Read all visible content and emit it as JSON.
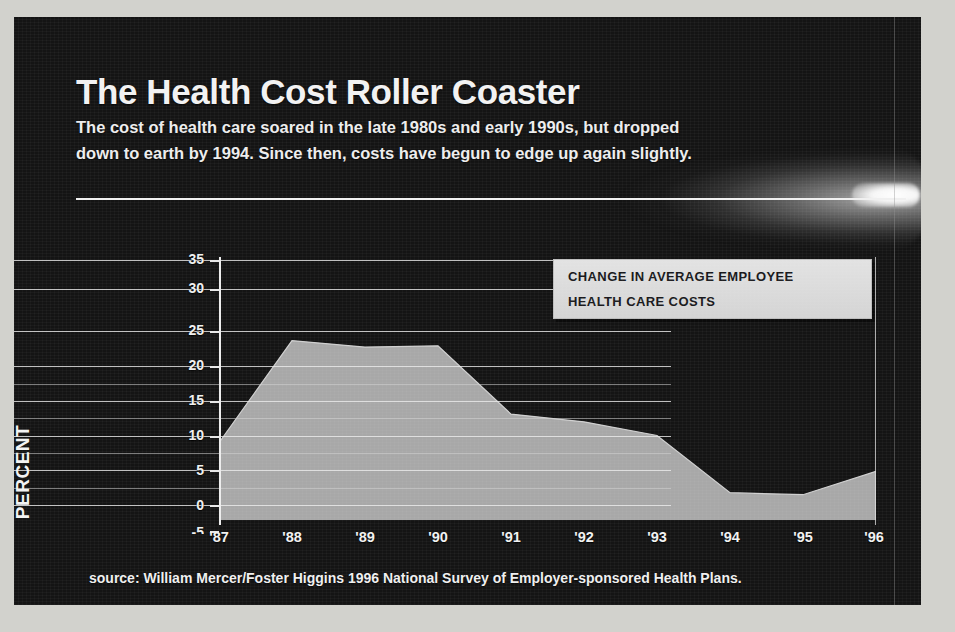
{
  "title": "The Health Cost Roller Coaster",
  "subtitle_line_1": "The cost of health care soared in the late 1980s and early 1990s, but dropped",
  "subtitle_line_2": "down to earth by 1994.  Since then, costs have begun to edge up again slightly.",
  "legend": {
    "line_1": "CHANGE IN AVERAGE  EMPLOYEE",
    "line_2": "HEALTH CARE COSTS"
  },
  "axis_title_y": "PERCENT",
  "source": "source:  William Mercer/Foster Higgins 1996 National Survey of Employer-sponsored Health Plans.",
  "colors": {
    "background": "#141414",
    "text": "#f2f2f2",
    "area_fill": "#a8a8a8",
    "gridline": "#ebebeb",
    "legend_bg": "#dcdcdc",
    "legend_text": "#18181b"
  },
  "chart_data": {
    "type": "area",
    "title": "The Health Cost Roller Coaster",
    "xlabel": "",
    "ylabel": "PERCENT",
    "legend": "CHANGE IN AVERAGE  EMPLOYEE HEALTH CARE COSTS",
    "legend_position": "top-right",
    "grid": true,
    "xlim": [
      "'87",
      "'96"
    ],
    "ylim": [
      -5,
      35
    ],
    "yticks": [
      35,
      30,
      25,
      20,
      15,
      10,
      5,
      0,
      -5
    ],
    "ytick_labels": [
      "35",
      "30",
      "25",
      "20",
      "15",
      "10",
      "5",
      "0",
      "-5"
    ],
    "x": [
      "'87",
      "'88",
      "'89",
      "'90",
      "'91",
      "'92",
      "'93",
      "'94",
      "'95",
      "'96"
    ],
    "xtick_labels": [
      "'87",
      "'88",
      "'89",
      "'90",
      "'91",
      "'92",
      "'93",
      "'94",
      "'95",
      "'96"
    ],
    "values": [
      6.9,
      22.6,
      21.6,
      21.8,
      11.3,
      10.1,
      8.0,
      -0.8,
      -1.1,
      2.5
    ],
    "series": [
      {
        "name": "Change in average employee health care costs",
        "values": [
          6.9,
          22.6,
          21.6,
          21.8,
          11.3,
          10.1,
          8.0,
          -0.8,
          -1.1,
          2.5
        ]
      }
    ],
    "units": "percent"
  }
}
